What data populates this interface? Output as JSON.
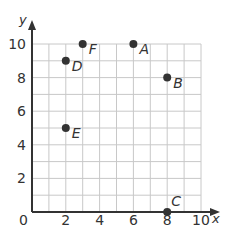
{
  "chart_data": {
    "type": "scatter",
    "title": "",
    "xlabel": "x",
    "ylabel": "y",
    "xlim": [
      0,
      10
    ],
    "ylim": [
      0,
      10
    ],
    "grid": true,
    "grid_step": 1,
    "x_ticks": [
      0,
      2,
      4,
      6,
      8,
      10
    ],
    "y_ticks": [
      2,
      4,
      6,
      8,
      10
    ],
    "points": [
      {
        "label": "A",
        "x": 6,
        "y": 10
      },
      {
        "label": "B",
        "x": 8,
        "y": 8
      },
      {
        "label": "C",
        "x": 8,
        "y": 0
      },
      {
        "label": "D",
        "x": 2,
        "y": 9
      },
      {
        "label": "E",
        "x": 2,
        "y": 5
      },
      {
        "label": "F",
        "x": 3,
        "y": 10
      }
    ]
  },
  "colors": {
    "grid": "#c8c8c8",
    "axis": "#333333",
    "point": "#333333"
  }
}
